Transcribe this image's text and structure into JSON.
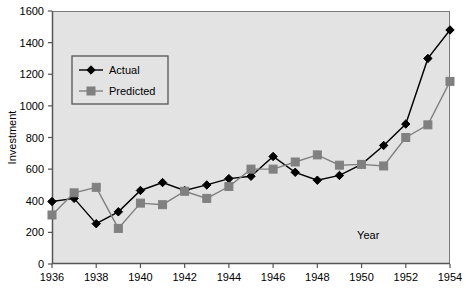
{
  "chart_data": {
    "type": "line",
    "title": "",
    "xlabel": "Year",
    "ylabel": "Investment",
    "x": [
      1936,
      1937,
      1938,
      1939,
      1940,
      1941,
      1942,
      1943,
      1944,
      1945,
      1946,
      1947,
      1948,
      1949,
      1950,
      1951,
      1952,
      1953,
      1954
    ],
    "xlim": [
      1936,
      1954
    ],
    "ylim": [
      0,
      1600
    ],
    "xticks": [
      1936,
      1938,
      1940,
      1942,
      1944,
      1946,
      1948,
      1950,
      1952,
      1954
    ],
    "xtick_labels": [
      "1936",
      "1938",
      "1940",
      "1942",
      "1944",
      "1946",
      "1948",
      "1950",
      "1952",
      "1954"
    ],
    "yticks": [
      0,
      200,
      400,
      600,
      800,
      1000,
      1200,
      1400,
      1600
    ],
    "ytick_labels": [
      "0",
      "200",
      "400",
      "600",
      "800",
      "1000",
      "1200",
      "1400",
      "1600"
    ],
    "grid": false,
    "legend_position": "upper left",
    "plot_background": "#e3e3e3",
    "series": [
      {
        "name": "Actual",
        "color": "#000000",
        "marker": "diamond",
        "values": [
          395,
          415,
          255,
          330,
          465,
          515,
          465,
          500,
          540,
          555,
          680,
          580,
          530,
          560,
          630,
          750,
          885,
          1300,
          1480
        ]
      },
      {
        "name": "Predicted",
        "color": "#808080",
        "marker": "square",
        "values": [
          310,
          450,
          485,
          225,
          385,
          375,
          460,
          415,
          490,
          600,
          600,
          645,
          690,
          625,
          630,
          620,
          800,
          880,
          1155
        ]
      }
    ]
  },
  "legend": {
    "items": [
      {
        "label": "Actual"
      },
      {
        "label": "Predicted"
      }
    ]
  },
  "axes": {
    "y_title": "Investment",
    "x_title": "Year"
  }
}
